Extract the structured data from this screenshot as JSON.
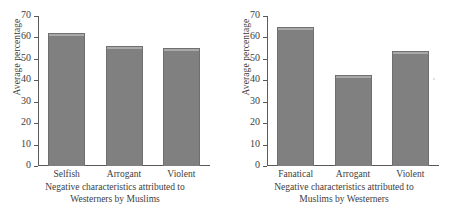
{
  "figure": {
    "background": "#ffffff",
    "bar_color": "#808080",
    "axis_color": "#5a5a5a",
    "text_color": "#3d3d3d"
  },
  "chart_data": [
    {
      "type": "bar",
      "panel": "left",
      "title": "",
      "categories": [
        "Selfish",
        "Arrogant",
        "Violent"
      ],
      "values": [
        62,
        56,
        55
      ],
      "xlabel_lines": [
        "Negative characteristics attributed to",
        "Westerners by Muslims"
      ],
      "ylabel": "Average percentage",
      "ylim": [
        0,
        70
      ],
      "yticks": [
        0,
        10,
        20,
        30,
        40,
        50,
        60,
        70
      ],
      "ytick_labels": [
        "0",
        "10",
        "20",
        "30",
        "40",
        "50",
        "60",
        "70"
      ],
      "grid": false,
      "legend": "none"
    },
    {
      "type": "bar",
      "panel": "right",
      "title": "",
      "categories": [
        "Fanatical",
        "Arrogant",
        "Violent"
      ],
      "values": [
        65,
        42.5,
        53.5
      ],
      "xlabel_lines": [
        "Negative characteristics attributed to",
        "Muslims by Westerners"
      ],
      "ylabel": "Average percentage",
      "ylim": [
        0,
        70
      ],
      "yticks": [
        0,
        10,
        20,
        30,
        40,
        50,
        60,
        70
      ],
      "ytick_labels": [
        "0",
        "10",
        "20",
        "30",
        "40",
        "50",
        "60",
        "70"
      ],
      "grid": false,
      "legend": "none"
    }
  ]
}
